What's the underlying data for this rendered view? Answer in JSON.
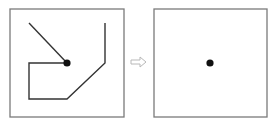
{
  "colors": {
    "background": "#ffffff",
    "frame": "#7a7a7a",
    "path": "#333333",
    "dot": "#111111",
    "arrow": "#b8b8b8"
  },
  "diagram": {
    "left_panel": {
      "frame": {
        "x": 10,
        "y": 9,
        "width": 114,
        "height": 108
      },
      "dot": {
        "cx": 67,
        "cy": 63,
        "r": 3.6
      },
      "diagonal_segment": {
        "x1": 29,
        "y1": 23,
        "x2": 67,
        "y2": 63
      },
      "polyline_points": "67,63 29,63 29,99 67,99 105,63 105,23"
    },
    "arrow": {
      "direction": "right",
      "icon": "hollow-right-arrow-icon",
      "points": "131,60 140,60 140,57 146,62 140,67 140,64 131,64"
    },
    "right_panel": {
      "frame": {
        "x": 154,
        "y": 9,
        "width": 113,
        "height": 108
      },
      "dot": {
        "cx": 210,
        "cy": 63,
        "r": 3.6
      }
    }
  }
}
